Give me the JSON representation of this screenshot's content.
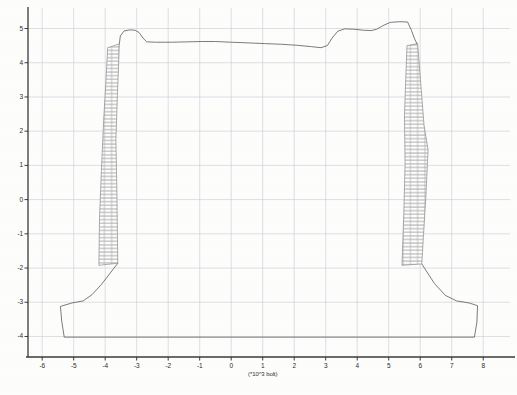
{
  "figure": {
    "kind": "engineering-cross-section",
    "background_color": "#fdfdfc",
    "line_color": "#5a5a5a",
    "grid_color": "#c9c9d6",
    "axis_color": "#3a3a3a",
    "hatch_color": "#8a8a8a"
  },
  "axes": {
    "x_title": "(*10^3 bolt)",
    "x_ticks": [
      "-6",
      "-5",
      "-4",
      "-3",
      "-2",
      "-1",
      "0",
      "1",
      "2",
      "3",
      "4",
      "5",
      "6",
      "7",
      "8"
    ],
    "x_tick_values": [
      -6,
      -5,
      -4,
      -3,
      -2,
      -1,
      0,
      1,
      2,
      3,
      4,
      5,
      6,
      7,
      8
    ],
    "y_ticks": [
      "5",
      "4",
      "3",
      "2",
      "1",
      "0",
      "-1",
      "-2",
      "-3",
      "-4"
    ],
    "y_tick_values": [
      5,
      4,
      3,
      2,
      1,
      0,
      -1,
      -2,
      -3,
      -4
    ],
    "xlim": [
      -6.45,
      8.85
    ],
    "ylim": [
      -4.6,
      5.6
    ],
    "grid": true,
    "grid_every": 1
  },
  "chart_data": {
    "type": "line",
    "title": "",
    "xlabel": "(*10^3 bolt)",
    "ylabel": "",
    "xlim": [
      -6.45,
      8.85
    ],
    "ylim": [
      -4.6,
      5.6
    ],
    "grid": true,
    "series": [
      {
        "name": "ground-surface-profile",
        "kind": "polyline",
        "points": [
          [
            -3.55,
            4.55
          ],
          [
            -3.52,
            4.78
          ],
          [
            -3.4,
            4.93
          ],
          [
            -3.22,
            4.96
          ],
          [
            -3.05,
            4.95
          ],
          [
            -2.92,
            4.88
          ],
          [
            -2.8,
            4.72
          ],
          [
            -2.68,
            4.61
          ],
          [
            -2.4,
            4.6
          ],
          [
            -1.9,
            4.6
          ],
          [
            -1.4,
            4.61
          ],
          [
            -0.95,
            4.62
          ],
          [
            -0.5,
            4.62
          ],
          [
            0.0,
            4.6
          ],
          [
            0.55,
            4.58
          ],
          [
            1.05,
            4.56
          ],
          [
            1.6,
            4.54
          ],
          [
            2.1,
            4.51
          ],
          [
            2.55,
            4.47
          ],
          [
            2.85,
            4.44
          ],
          [
            3.05,
            4.5
          ],
          [
            3.2,
            4.72
          ],
          [
            3.38,
            4.92
          ],
          [
            3.6,
            4.99
          ],
          [
            3.9,
            4.98
          ],
          [
            4.2,
            4.95
          ],
          [
            4.45,
            4.94
          ],
          [
            4.62,
            4.98
          ],
          [
            4.85,
            5.1
          ],
          [
            5.05,
            5.18
          ],
          [
            5.35,
            5.2
          ],
          [
            5.6,
            5.19
          ],
          [
            5.72,
            4.95
          ],
          [
            5.82,
            4.7
          ],
          [
            5.9,
            4.55
          ]
        ]
      },
      {
        "name": "left-footing-outline",
        "kind": "polyline",
        "points": [
          [
            -3.6,
            -1.86
          ],
          [
            -4.12,
            -2.48
          ],
          [
            -4.42,
            -2.78
          ],
          [
            -4.7,
            -2.96
          ],
          [
            -5.05,
            -3.02
          ],
          [
            -5.42,
            -3.12
          ],
          [
            -5.38,
            -3.55
          ],
          [
            -5.3,
            -4.02
          ]
        ]
      },
      {
        "name": "right-footing-outline",
        "kind": "polyline",
        "points": [
          [
            6.05,
            -1.88
          ],
          [
            6.45,
            -2.45
          ],
          [
            6.8,
            -2.8
          ],
          [
            7.15,
            -2.96
          ],
          [
            7.55,
            -3.02
          ],
          [
            7.82,
            -3.1
          ],
          [
            7.8,
            -3.58
          ],
          [
            7.72,
            -4.02
          ]
        ]
      },
      {
        "name": "baseline",
        "kind": "polyline",
        "points": [
          [
            -5.3,
            -4.02
          ],
          [
            7.72,
            -4.02
          ]
        ]
      }
    ],
    "hatched_regions": [
      {
        "name": "left-column",
        "pattern": "running-bond-brick",
        "outline": [
          [
            -3.92,
            4.44
          ],
          [
            -3.55,
            4.55
          ],
          [
            -3.61,
            3.1
          ],
          [
            -3.66,
            1.72
          ],
          [
            -3.63,
            0.35
          ],
          [
            -3.6,
            -1.86
          ],
          [
            -4.2,
            -1.92
          ],
          [
            -4.18,
            -0.55
          ],
          [
            -4.12,
            0.85
          ],
          [
            -4.05,
            2.3
          ],
          [
            -3.98,
            3.4
          ]
        ]
      },
      {
        "name": "right-column",
        "pattern": "running-bond-brick",
        "outline": [
          [
            5.58,
            4.5
          ],
          [
            5.92,
            4.56
          ],
          [
            6.02,
            3.35
          ],
          [
            6.12,
            2.18
          ],
          [
            6.25,
            1.45
          ],
          [
            6.18,
            0.1
          ],
          [
            6.1,
            -1.1
          ],
          [
            6.05,
            -1.88
          ],
          [
            5.42,
            -1.92
          ],
          [
            5.48,
            -0.4
          ],
          [
            5.52,
            1.05
          ],
          [
            5.5,
            2.45
          ],
          [
            5.54,
            3.5
          ]
        ]
      }
    ]
  }
}
